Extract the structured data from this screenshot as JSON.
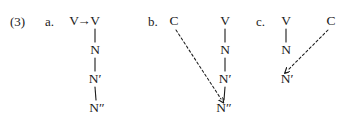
{
  "figure": {
    "example_number": "(3)",
    "background_color": "#ffffff",
    "ink_color": "#1a1a1a",
    "width": 358,
    "height": 124
  },
  "items": [
    {
      "label": "a.",
      "rewrite_rule": {
        "left": "V",
        "arrow": "→",
        "right": "V"
      },
      "nodes": [
        {
          "text": "V",
          "x": 95,
          "y": 21
        },
        {
          "text": "N",
          "x": 95,
          "y": 50
        },
        {
          "text": "N′",
          "x": 95,
          "y": 79
        },
        {
          "text": "N″",
          "x": 97,
          "y": 108
        }
      ],
      "solid_edges": [
        {
          "x1": 95,
          "y1": 29,
          "x2": 95,
          "y2": 42
        },
        {
          "x1": 95,
          "y1": 58,
          "x2": 95,
          "y2": 71
        },
        {
          "x1": 95,
          "y1": 87,
          "x2": 96,
          "y2": 100
        }
      ],
      "dashed_arrows": []
    },
    {
      "label": "b.",
      "nodes": [
        {
          "text": "C",
          "x": 174,
          "y": 21
        },
        {
          "text": "V",
          "x": 225,
          "y": 21
        },
        {
          "text": "N",
          "x": 225,
          "y": 50
        },
        {
          "text": "N′",
          "x": 225,
          "y": 79
        },
        {
          "text": "N″",
          "x": 224,
          "y": 108
        }
      ],
      "solid_edges": [
        {
          "x1": 225,
          "y1": 29,
          "x2": 225,
          "y2": 42
        },
        {
          "x1": 225,
          "y1": 58,
          "x2": 225,
          "y2": 71
        },
        {
          "x1": 225,
          "y1": 87,
          "x2": 224,
          "y2": 100
        }
      ],
      "dashed_arrows": [
        {
          "x1": 176,
          "y1": 30,
          "x2": 221,
          "y2": 99
        }
      ]
    },
    {
      "label": "c.",
      "nodes": [
        {
          "text": "V",
          "x": 286,
          "y": 21
        },
        {
          "text": "C",
          "x": 331,
          "y": 21
        },
        {
          "text": "N",
          "x": 286,
          "y": 50
        },
        {
          "text": "N′",
          "x": 287,
          "y": 79
        }
      ],
      "solid_edges": [
        {
          "x1": 286,
          "y1": 29,
          "x2": 286,
          "y2": 42
        }
      ],
      "dashed_arrows": [
        {
          "x1": 328,
          "y1": 30,
          "x2": 288,
          "y2": 70
        }
      ]
    }
  ],
  "text_positions": {
    "example_num": {
      "x": 10,
      "y": 15
    },
    "label_a": {
      "x": 45,
      "y": 15
    },
    "rule_left": {
      "x": 74,
      "y": 21
    },
    "rule_arrow": {
      "x": 84,
      "y": 21
    },
    "label_b": {
      "x": 148,
      "y": 15
    },
    "label_c": {
      "x": 256,
      "y": 15
    }
  }
}
